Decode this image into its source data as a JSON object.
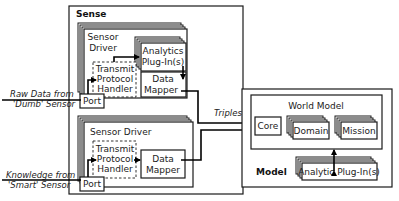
{
  "sense": {
    "title": "Sense",
    "driver1": {
      "title_line1": "Sensor",
      "title_line2": "Driver",
      "analytics_line1": "Analytics",
      "analytics_line2": "Plug-In(s)",
      "transmit_line1": "Transmit",
      "transmit_line2": "Protocol",
      "transmit_line3": "Handler",
      "mapper_line1": "Data",
      "mapper_line2": "Mapper",
      "port": "Port"
    },
    "driver2": {
      "title": "Sensor Driver",
      "transmit_line1": "Transmit",
      "transmit_line2": "Protocol",
      "transmit_line3": "Handler",
      "mapper_line1": "Data",
      "mapper_line2": "Mapper",
      "port": "Port"
    }
  },
  "inputs": {
    "raw_line1": "Raw Data from",
    "raw_line2": "'Dumb' Sensor",
    "knowledge_line1": "Knowledge from",
    "knowledge_line2": "'Smart' Sensor"
  },
  "connector_label": "Triples",
  "model": {
    "title": "Model",
    "world_model": "World Model",
    "core": "Core",
    "domain": "Domain",
    "mission": "Mission",
    "analytic_plugins": "Analytic Plug-In(s)"
  }
}
